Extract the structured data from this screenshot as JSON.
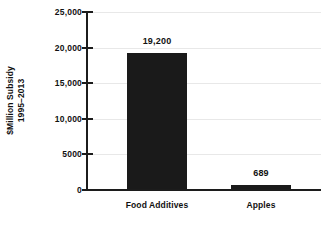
{
  "chart_data": {
    "type": "bar",
    "title": "",
    "subtitle": "",
    "xlabel": "",
    "ylabel": "$Million Subsidy 1995–2013",
    "ylabel_lines": [
      "$Million Subsidy",
      "1995–2013"
    ],
    "categories": [
      "Food Additives",
      "Apples"
    ],
    "values": [
      19200,
      689
    ],
    "value_labels": [
      "19,200",
      "689"
    ],
    "ylim": [
      0,
      25000
    ],
    "ytick_values": [
      25000,
      20000,
      15000,
      10000,
      5000,
      0
    ],
    "ytick_labels": [
      "25,000",
      "20,000",
      "15,000",
      "10,000",
      "5000",
      "0"
    ],
    "grid": true,
    "grid_orientation": "horizontal",
    "legend": false,
    "legend_position": "none",
    "series": [
      {
        "name": "Subsidy",
        "values": [
          19200,
          689
        ]
      }
    ],
    "colors": {
      "bar": "#1a1a1a",
      "axis": "#1c1c1c",
      "grid": "#e8e8e8",
      "text": "#111111",
      "background": "#ffffff"
    }
  }
}
